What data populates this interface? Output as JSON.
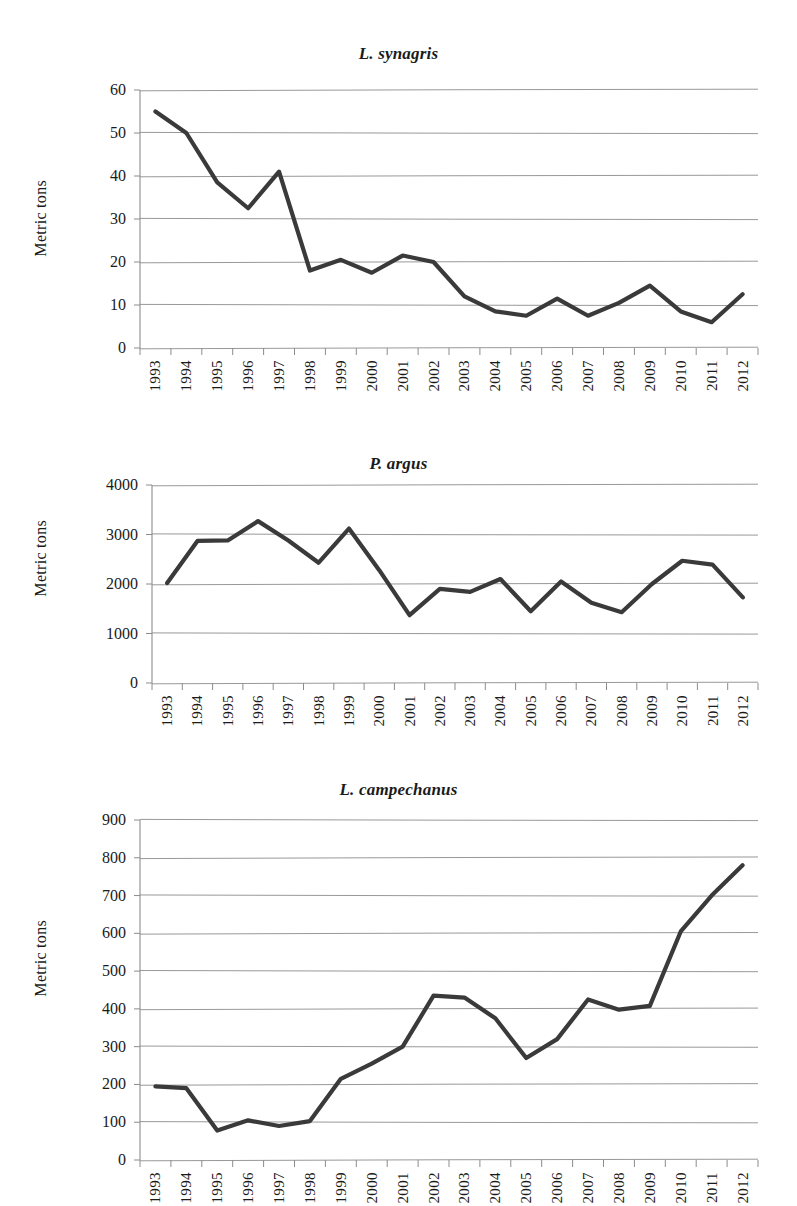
{
  "page": {
    "background": "#ffffff",
    "line_color": "#3a3a3a",
    "grid_color": "#8c8c8c"
  },
  "shared": {
    "ylabel": "Metric tons",
    "years": [
      "1993",
      "1994",
      "1995",
      "1996",
      "1997",
      "1998",
      "1999",
      "2000",
      "2001",
      "2002",
      "2003",
      "2004",
      "2005",
      "2006",
      "2007",
      "2008",
      "2009",
      "2010",
      "2011",
      "2012"
    ]
  },
  "chart_data": [
    {
      "type": "line",
      "title": "L. synagris",
      "xlabel": "",
      "ylabel": "Metric tons",
      "categories": [
        "1993",
        "1994",
        "1995",
        "1996",
        "1997",
        "1998",
        "1999",
        "2000",
        "2001",
        "2002",
        "2003",
        "2004",
        "2005",
        "2006",
        "2007",
        "2008",
        "2009",
        "2010",
        "2011",
        "2012"
      ],
      "values": [
        55,
        50,
        38.5,
        32.5,
        41,
        18,
        20.5,
        17.5,
        21.5,
        20,
        12,
        8.5,
        7.5,
        11.5,
        7.5,
        10.5,
        14.5,
        8.5,
        6,
        12.5
      ],
      "ylim": [
        0,
        60
      ],
      "yticks": [
        0,
        10,
        20,
        30,
        40,
        50,
        60
      ],
      "ytick_labels": [
        "0",
        "10",
        "20",
        "30",
        "40",
        "50",
        "60"
      ],
      "grid": true,
      "legend": "none"
    },
    {
      "type": "line",
      "title": "P. argus",
      "xlabel": "",
      "ylabel": "Metric tons",
      "categories": [
        "1993",
        "1994",
        "1995",
        "1996",
        "1997",
        "1998",
        "1999",
        "2000",
        "2001",
        "2002",
        "2003",
        "2004",
        "2005",
        "2006",
        "2007",
        "2008",
        "2009",
        "2010",
        "2011",
        "2012"
      ],
      "values": [
        2020,
        2870,
        2880,
        3270,
        2880,
        2430,
        3120,
        2280,
        1370,
        1900,
        1840,
        2100,
        1450,
        2050,
        1620,
        1430,
        2000,
        2470,
        2390,
        1730
      ],
      "ylim": [
        0,
        4000
      ],
      "yticks": [
        0,
        1000,
        2000,
        3000,
        4000
      ],
      "ytick_labels": [
        "0",
        "1000",
        "2000",
        "3000",
        "4000"
      ],
      "grid": true,
      "legend": "none"
    },
    {
      "type": "line",
      "title": "L. campechanus",
      "xlabel": "",
      "ylabel": "Metric tons",
      "categories": [
        "1993",
        "1994",
        "1995",
        "1996",
        "1997",
        "1998",
        "1999",
        "2000",
        "2001",
        "2002",
        "2003",
        "2004",
        "2005",
        "2006",
        "2007",
        "2008",
        "2009",
        "2010",
        "2011",
        "2012"
      ],
      "values": [
        195,
        190,
        78,
        105,
        90,
        103,
        215,
        255,
        300,
        435,
        430,
        375,
        270,
        320,
        425,
        398,
        408,
        605,
        700,
        780
      ],
      "ylim": [
        0,
        900
      ],
      "yticks": [
        0,
        100,
        200,
        300,
        400,
        500,
        600,
        700,
        800,
        900
      ],
      "ytick_labels": [
        "0",
        "100",
        "200",
        "300",
        "400",
        "500",
        "600",
        "700",
        "800",
        "900"
      ],
      "grid": true,
      "legend": "none"
    }
  ]
}
